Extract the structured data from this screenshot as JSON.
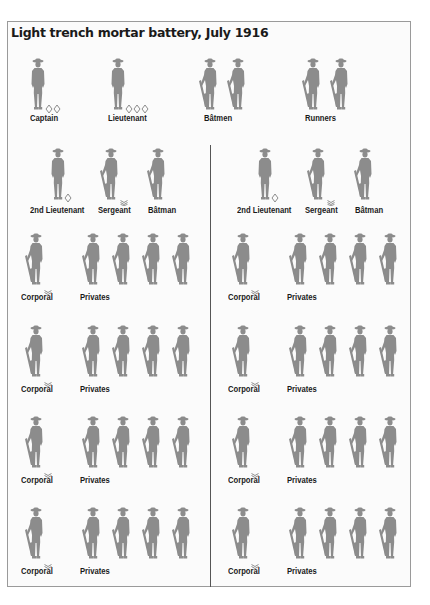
{
  "title": "Light trench mortar battery, July 1916",
  "colors": {
    "figure": "#8c8c8c",
    "text": "#1a1a1a",
    "border": "#9a9a9a",
    "divider": "#555555"
  },
  "headquarters": {
    "groups": [
      {
        "label": "Captain",
        "figures": 1,
        "rank_insignia": "two-pips",
        "armed": false
      },
      {
        "label": "Lieutenant",
        "figures": 1,
        "rank_insignia": "three-pips",
        "armed": false
      },
      {
        "label": "Bâtmen",
        "figures": 2,
        "rank_insignia": "none",
        "armed": true
      },
      {
        "label": "Runners",
        "figures": 2,
        "rank_insignia": "none",
        "armed": true
      }
    ]
  },
  "sections": [
    {
      "leaders": [
        {
          "label": "2nd Lieutenant",
          "rank_insignia": "one-pip",
          "armed": false
        },
        {
          "label": "Sergeant",
          "rank_insignia": "three-chevrons",
          "armed": true
        },
        {
          "label": "Bâtman",
          "rank_insignia": "none",
          "armed": true
        }
      ],
      "squads": [
        {
          "corporal_label": "Corporal",
          "privates_label": "Privates",
          "privates": 4
        },
        {
          "corporal_label": "Corporal",
          "privates_label": "Privates",
          "privates": 4
        },
        {
          "corporal_label": "Corporal",
          "privates_label": "Privates",
          "privates": 4
        },
        {
          "corporal_label": "Corporal",
          "privates_label": "Privates",
          "privates": 4
        }
      ]
    },
    {
      "leaders": [
        {
          "label": "2nd Lieutenant",
          "rank_insignia": "one-pip",
          "armed": false
        },
        {
          "label": "Sergeant",
          "rank_insignia": "three-chevrons",
          "armed": true
        },
        {
          "label": "Bâtman",
          "rank_insignia": "none",
          "armed": true
        }
      ],
      "squads": [
        {
          "corporal_label": "Corporal",
          "privates_label": "Privates",
          "privates": 4
        },
        {
          "corporal_label": "Corporal",
          "privates_label": "Privates",
          "privates": 4
        },
        {
          "corporal_label": "Corporal",
          "privates_label": "Privates",
          "privates": 4
        },
        {
          "corporal_label": "Corporal",
          "privates_label": "Privates",
          "privates": 4
        }
      ]
    }
  ]
}
